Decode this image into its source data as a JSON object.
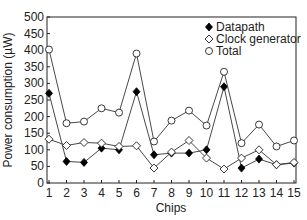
{
  "chart_data": {
    "type": "line",
    "title": "",
    "xlabel": "Chips",
    "ylabel": "Power consumption (µW)",
    "x": [
      1,
      2,
      3,
      4,
      5,
      6,
      7,
      8,
      9,
      10,
      11,
      12,
      13,
      14,
      15
    ],
    "xlim": [
      1,
      15
    ],
    "ylim": [
      0,
      500
    ],
    "yticks": [
      0,
      50,
      100,
      150,
      200,
      250,
      300,
      350,
      400,
      450,
      500
    ],
    "xticks": [
      1,
      2,
      3,
      4,
      5,
      6,
      7,
      8,
      9,
      10,
      11,
      12,
      13,
      14,
      15
    ],
    "grid": false,
    "legend_position": "upper right",
    "series": [
      {
        "name": "Datapath",
        "marker": "filled-diamond",
        "values": [
          270,
          65,
          62,
          105,
          100,
          275,
          85,
          90,
          90,
          100,
          290,
          45,
          72,
          55,
          60
        ]
      },
      {
        "name": "Clock generator",
        "marker": "open-diamond",
        "values": [
          132,
          113,
          122,
          120,
          110,
          112,
          45,
          93,
          128,
          75,
          42,
          75,
          100,
          55,
          62
        ]
      },
      {
        "name": "Total",
        "marker": "open-circle",
        "values": [
          402,
          180,
          185,
          225,
          212,
          390,
          125,
          188,
          218,
          173,
          335,
          120,
          176,
          110,
          128
        ]
      }
    ]
  }
}
